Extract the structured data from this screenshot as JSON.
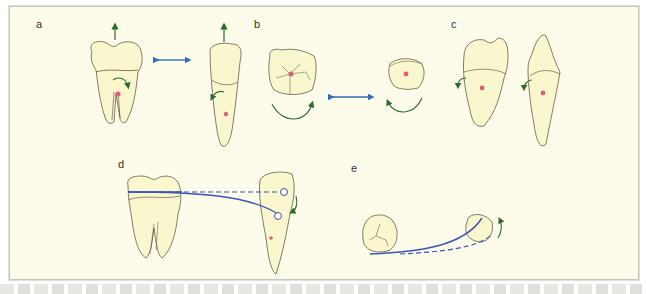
{
  "figure": {
    "panels": [
      {
        "id": "a",
        "label": "a"
      },
      {
        "id": "b",
        "label": "b"
      },
      {
        "id": "c",
        "label": "c"
      },
      {
        "id": "d",
        "label": "d"
      },
      {
        "id": "e",
        "label": "e"
      }
    ],
    "colors": {
      "background": "#fdfbea",
      "tooth_fill": "#faf7cf",
      "outline": "#4a4a30",
      "green_arrow": "#2e6b2e",
      "blue_arrow": "#2f6fb5",
      "pink_center": "#e0607a",
      "blue_line": "#3b55b0"
    }
  },
  "caption": {
    "visible": true,
    "legible": false
  }
}
